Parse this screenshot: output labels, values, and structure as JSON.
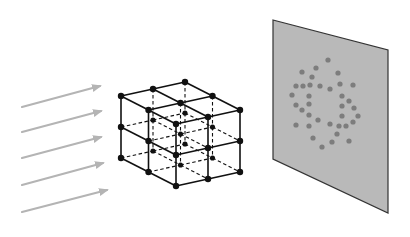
{
  "figure": {
    "title": ""
  },
  "colors": {
    "background": "#ffffff",
    "beam": "#b4b4b4",
    "lattice_line": "#111111",
    "lattice_node": "#111111",
    "screen_fill": "#b9b9b9",
    "screen_edge": "#333333",
    "spot": "#7d7d7d"
  },
  "beams": {
    "count": 5,
    "items": [
      {
        "x1": 22,
        "y1": 107,
        "x2": 100,
        "y2": 86
      },
      {
        "x1": 22,
        "y1": 132,
        "x2": 101,
        "y2": 111
      },
      {
        "x1": 22,
        "y1": 158,
        "x2": 101,
        "y2": 137
      },
      {
        "x1": 22,
        "y1": 185,
        "x2": 103,
        "y2": 163
      },
      {
        "x1": 22,
        "y1": 212,
        "x2": 107,
        "y2": 190
      }
    ]
  },
  "lattice": {
    "type": "cubic",
    "cells_per_side": 2,
    "origin": [
      121,
      96
    ],
    "vec_a": [
      27.5,
      14
    ],
    "vec_b": [
      32,
      -7
    ],
    "vec_c": [
      0,
      31
    ],
    "node_radius": 3.2
  },
  "screen": {
    "corners": [
      [
        273,
        20
      ],
      [
        388,
        50
      ],
      [
        388,
        213
      ],
      [
        273,
        159
      ]
    ],
    "spots": [
      [
        328,
        60
      ],
      [
        302,
        72
      ],
      [
        316,
        68
      ],
      [
        338,
        73
      ],
      [
        312,
        77
      ],
      [
        296,
        86
      ],
      [
        303,
        86
      ],
      [
        310,
        85
      ],
      [
        320,
        86
      ],
      [
        330,
        89
      ],
      [
        340,
        84
      ],
      [
        353,
        85
      ],
      [
        292,
        95
      ],
      [
        309,
        96
      ],
      [
        342,
        96
      ],
      [
        349,
        101
      ],
      [
        296,
        105
      ],
      [
        309,
        104
      ],
      [
        342,
        106
      ],
      [
        354,
        108
      ],
      [
        302,
        110
      ],
      [
        309,
        115
      ],
      [
        342,
        116
      ],
      [
        358,
        116
      ],
      [
        296,
        125
      ],
      [
        309,
        126
      ],
      [
        318,
        120
      ],
      [
        330,
        124
      ],
      [
        339,
        126
      ],
      [
        346,
        126
      ],
      [
        353,
        122
      ],
      [
        313,
        138
      ],
      [
        337,
        134
      ],
      [
        322,
        147
      ],
      [
        332,
        142
      ],
      [
        349,
        141
      ]
    ]
  }
}
